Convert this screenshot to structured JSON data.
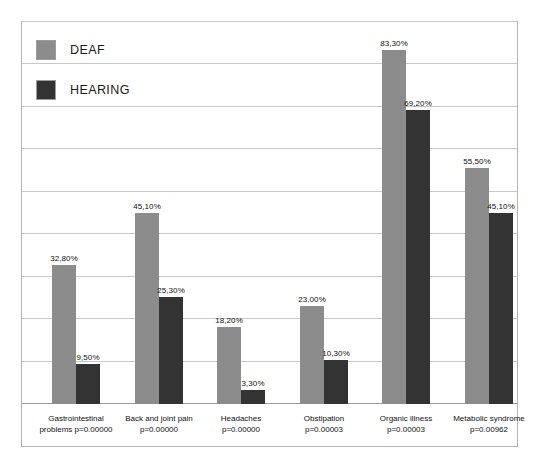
{
  "chart_data": {
    "type": "bar",
    "title": "",
    "xlabel": "",
    "ylabel": "",
    "ylim": [
      0,
      90
    ],
    "grid": true,
    "gridline_values": [
      0,
      10,
      20,
      30,
      40,
      50,
      60,
      70,
      80,
      90
    ],
    "legend_position": "top-left",
    "categories": [
      "Gastrointestinal\nproblems p=0.00000",
      "Back and joint pain\np=0.00000",
      "Headaches\np=0.00000",
      "Obstipation\np=0.00003",
      "Organic illness\np=0.00003",
      "Metabolic syndrome\np=0.00962"
    ],
    "series": [
      {
        "name": "DEAF",
        "color": "#8c8c8c",
        "values": [
          32.8,
          45.1,
          18.2,
          23.0,
          83.3,
          55.5
        ],
        "labels": [
          "32,80%",
          "45,10%",
          "18,20%",
          "23,00%",
          "83,30%",
          "55,50%"
        ]
      },
      {
        "name": "HEARING",
        "color": "#333333",
        "values": [
          9.5,
          25.3,
          3.3,
          10.3,
          69.2,
          45.1
        ],
        "labels": [
          "9,50%",
          "25,30%",
          "3,30%",
          "10,30%",
          "69,20%",
          "45,10%"
        ]
      }
    ]
  },
  "legend": {
    "items": [
      {
        "label": "DEAF",
        "color": "#8c8c8c"
      },
      {
        "label": "HEARING",
        "color": "#333333"
      }
    ]
  },
  "colors": {
    "deaf": "#8c8c8c",
    "hearing": "#333333",
    "gridline": "#c8c8c8",
    "frame_border": "#b4b4b4",
    "background": "#ffffff"
  }
}
